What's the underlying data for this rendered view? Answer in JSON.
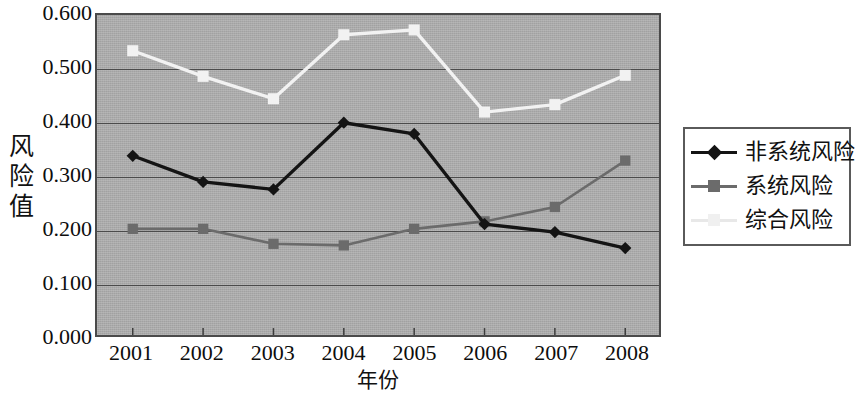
{
  "chart_data": {
    "type": "line",
    "title": "",
    "xlabel": "年份",
    "ylabel": "风险值",
    "categories": [
      "2001",
      "2002",
      "2003",
      "2004",
      "2005",
      "2006",
      "2007",
      "2008"
    ],
    "ylim": [
      0.0,
      0.6
    ],
    "ytick_labels": [
      "0.600",
      "0.500",
      "0.400",
      "0.300",
      "0.200",
      "0.100",
      "0.000"
    ],
    "ytick_values": [
      0.6,
      0.5,
      0.4,
      0.3,
      0.2,
      0.1,
      0.0
    ],
    "grid": true,
    "legend_position": "right",
    "plot_background": "#acacac",
    "series": [
      {
        "name": "非系统风险",
        "marker": "diamond",
        "color": "#141414",
        "values": [
          0.336,
          0.287,
          0.273,
          0.398,
          0.377,
          0.208,
          0.193,
          0.163
        ]
      },
      {
        "name": "系统风险",
        "marker": "square",
        "color": "#6b6b6b",
        "values": [
          0.199,
          0.199,
          0.171,
          0.168,
          0.199,
          0.213,
          0.24,
          0.327
        ]
      },
      {
        "name": "综合风险",
        "marker": "square",
        "color": "#f2f2f2",
        "values": [
          0.533,
          0.485,
          0.443,
          0.563,
          0.572,
          0.418,
          0.432,
          0.487
        ]
      }
    ]
  },
  "axis": {
    "y_title_chars": [
      "风",
      "险",
      "值"
    ],
    "x_title": "年份"
  },
  "legend": {
    "items": [
      {
        "label": "非系统风险",
        "color": "#141414",
        "marker": "diamond"
      },
      {
        "label": "系统风险",
        "color": "#6b6b6b",
        "marker": "square"
      },
      {
        "label": "综合风险",
        "color": "#f0f0f0",
        "marker": "square"
      }
    ]
  }
}
